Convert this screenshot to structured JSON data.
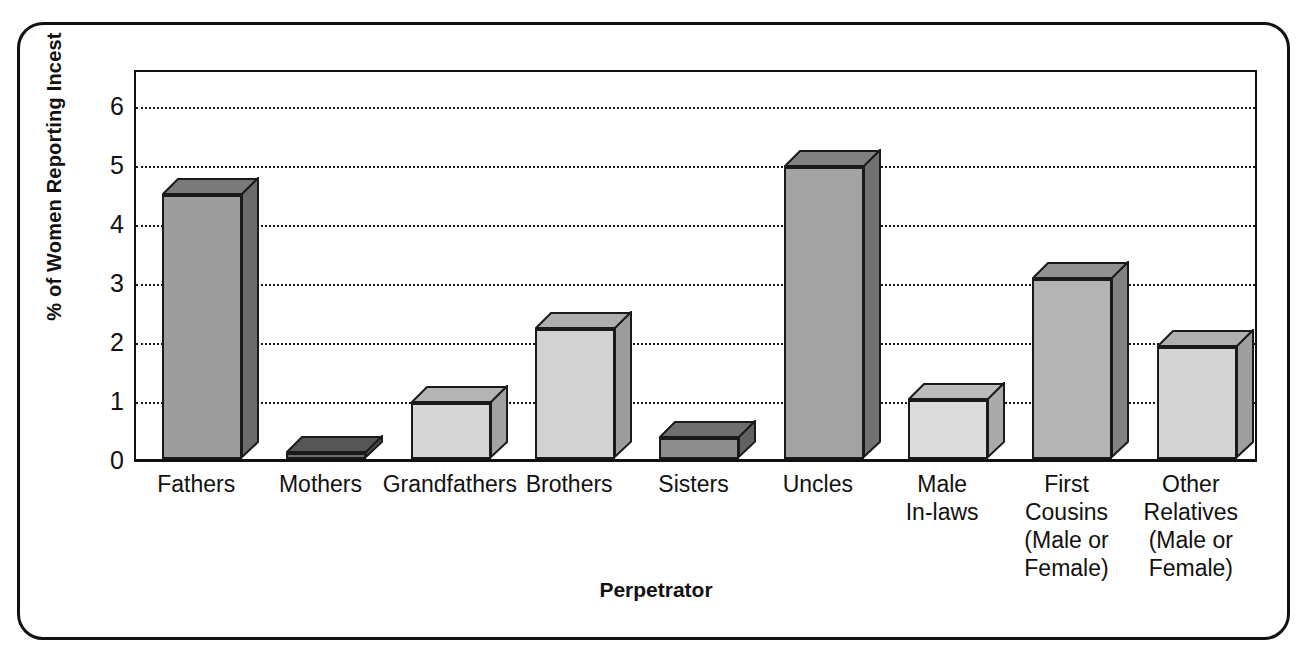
{
  "chart_data": {
    "type": "bar",
    "title": "",
    "xlabel": "Perpetrator",
    "ylabel": "% of Women Reporting Incest",
    "ylim": [
      0,
      6.6
    ],
    "yticks": [
      0,
      1,
      2,
      3,
      4,
      5,
      6
    ],
    "ytick_labels": [
      "0",
      "1",
      "2",
      "3",
      "4",
      "5",
      "6"
    ],
    "grid": "horizontal-dotted",
    "legend": "none",
    "categories": [
      "Fathers",
      "Mothers",
      "Grandfathers",
      "Brothers",
      "Sisters",
      "Uncles",
      "Male\nIn-laws",
      "First\nCousins\n(Male or\nFemale)",
      "Other\nRelatives\n(Male or\nFemale)"
    ],
    "category_lines": [
      [
        "Fathers"
      ],
      [
        "Mothers"
      ],
      [
        "Grandfathers"
      ],
      [
        "Brothers"
      ],
      [
        "Sisters"
      ],
      [
        "Uncles"
      ],
      [
        "Male",
        "In-laws"
      ],
      [
        "First",
        "Cousins",
        "(Male or",
        "Female)"
      ],
      [
        "Other",
        "Relatives",
        "(Male or",
        "Female)"
      ]
    ],
    "values": [
      4.48,
      0.1,
      0.95,
      2.2,
      0.35,
      4.95,
      1.0,
      3.05,
      1.9
    ],
    "bar_fills": [
      "#9d9d9d",
      "#6d6d6d",
      "#d7d7d7",
      "#d2d2d2",
      "#8d8d8d",
      "#a3a3a3",
      "#dcdcdc",
      "#b4b4b4",
      "#d4d4d4"
    ],
    "bar_top_fills": [
      "#7a7a7a",
      "#565656",
      "#b4b4b4",
      "#aeaeae",
      "#6f6f6f",
      "#808080",
      "#bcbcbc",
      "#919191",
      "#b0b0b0"
    ],
    "bar_side_fills": [
      "#6b6b6b",
      "#4c4c4c",
      "#a2a2a2",
      "#9c9c9c",
      "#626262",
      "#717171",
      "#aaaaaa",
      "#828282",
      "#9e9e9e"
    ]
  },
  "axes": {
    "y_title": "% of Women Reporting Incest",
    "x_title": "Perpetrator"
  },
  "style_colors": {
    "frame": "#111111",
    "gridline": "#1a1a1a",
    "background": "#ffffff",
    "text": "#111111"
  }
}
